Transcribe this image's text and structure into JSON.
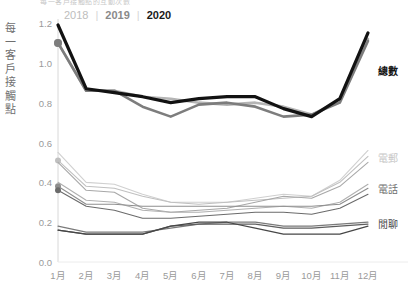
{
  "title_clipped": "每一客戶接觸點的互動次數",
  "legend": {
    "years": [
      {
        "label": "2018",
        "color": "#bdbdbd"
      },
      {
        "label": "2019",
        "color": "#8a8a8a"
      },
      {
        "label": "2020",
        "color": "#1a1a1a"
      }
    ],
    "separator": "|"
  },
  "axis": {
    "ylabel_chars": [
      "每",
      "一",
      "客",
      "戶",
      "接",
      "觸",
      "點"
    ],
    "yticks": [
      "1.2",
      "1.0",
      "0.8",
      "0.6",
      "0.4",
      "0.2",
      "0.0"
    ],
    "xticks": [
      "1月",
      "2月",
      "3月",
      "4月",
      "5月",
      "6月",
      "7月",
      "8月",
      "9月",
      "10月",
      "11月",
      "12月"
    ]
  },
  "series_labels": {
    "total": "總數",
    "email": "電郵",
    "phone": "電話",
    "chat": "閒聊"
  },
  "colors": {
    "y2018": "#c4c4c4",
    "y2019": "#8d8d8d",
    "y2020": "#141414",
    "total_2018": "#b5b5b5",
    "total_2019": "#7d7d7d",
    "total_2020": "#121212",
    "email_2018": "#d0d0d0",
    "email_2019": "#c0c0c0",
    "email_2020": "#a8a8a8",
    "phone_2018": "#b0b0b0",
    "phone_2019": "#8e8e8e",
    "phone_2020": "#6b6b6b",
    "chat_2018": "#7a7a7a",
    "chat_2019": "#5e5e5e",
    "chat_2020": "#474747",
    "axis": "#d8d8d8",
    "tick_text": "#9a9a9a"
  },
  "chart_data": {
    "type": "line",
    "title": "每一客戶接觸點的互動次數",
    "xlabel": "",
    "ylabel": "每一客戶接觸點",
    "categories": [
      "1月",
      "2月",
      "3月",
      "4月",
      "5月",
      "6月",
      "7月",
      "8月",
      "9月",
      "10月",
      "11月",
      "12月"
    ],
    "ylim": [
      0.0,
      1.2
    ],
    "yticks": [
      0.0,
      0.2,
      0.4,
      0.6,
      0.8,
      1.0,
      1.2
    ],
    "grid": false,
    "legend_position": "top-left (years), right (metrics)",
    "groups": [
      {
        "name": "總數",
        "label_y": 0.965,
        "series": [
          {
            "name": "2018",
            "year": 2018,
            "color": "#b5b5b5",
            "values": [
              1.1,
              0.86,
              0.86,
              0.83,
              0.82,
              0.8,
              0.79,
              0.8,
              0.78,
              0.74,
              0.81,
              1.12
            ],
            "marker_jan": true
          },
          {
            "name": "2019",
            "year": 2019,
            "color": "#7d7d7d",
            "values": [
              1.1,
              0.86,
              0.86,
              0.78,
              0.73,
              0.79,
              0.8,
              0.78,
              0.73,
              0.74,
              0.8,
              1.11
            ],
            "marker_jan": true
          },
          {
            "name": "2020",
            "year": 2020,
            "color": "#121212",
            "values": [
              1.19,
              0.87,
              0.85,
              0.83,
              0.8,
              0.82,
              0.83,
              0.83,
              0.77,
              0.73,
              0.82,
              1.15
            ],
            "marker_jan": false
          }
        ]
      },
      {
        "name": "電郵",
        "label_y": 0.525,
        "series": [
          {
            "name": "2018",
            "year": 2018,
            "color": "#d0d0d0",
            "values": [
              0.55,
              0.4,
              0.39,
              0.34,
              0.3,
              0.3,
              0.3,
              0.32,
              0.34,
              0.33,
              0.41,
              0.56
            ],
            "marker_jan": false
          },
          {
            "name": "2019",
            "year": 2019,
            "color": "#c0c0c0",
            "values": [
              0.51,
              0.38,
              0.37,
              0.33,
              0.3,
              0.29,
              0.3,
              0.31,
              0.32,
              0.33,
              0.4,
              0.53
            ],
            "marker_jan": true
          },
          {
            "name": "2020",
            "year": 2020,
            "color": "#a8a8a8",
            "values": [
              0.5,
              0.36,
              0.35,
              0.27,
              0.25,
              0.26,
              0.27,
              0.3,
              0.33,
              0.32,
              0.38,
              0.5
            ],
            "marker_jan": false
          }
        ]
      },
      {
        "name": "電話",
        "label_y": 0.37,
        "series": [
          {
            "name": "2018",
            "year": 2018,
            "color": "#b0b0b0",
            "values": [
              0.4,
              0.31,
              0.3,
              0.26,
              0.25,
              0.25,
              0.26,
              0.27,
              0.28,
              0.27,
              0.3,
              0.39
            ],
            "marker_jan": false
          },
          {
            "name": "2019",
            "year": 2019,
            "color": "#8e8e8e",
            "values": [
              0.38,
              0.29,
              0.29,
              0.28,
              0.28,
              0.28,
              0.28,
              0.28,
              0.28,
              0.28,
              0.29,
              0.37
            ],
            "marker_jan": true
          },
          {
            "name": "2020",
            "year": 2020,
            "color": "#6b6b6b",
            "values": [
              0.36,
              0.28,
              0.26,
              0.22,
              0.22,
              0.23,
              0.24,
              0.25,
              0.25,
              0.24,
              0.27,
              0.34
            ],
            "marker_jan": true
          }
        ]
      },
      {
        "name": "閒聊",
        "label_y": 0.195,
        "series": [
          {
            "name": "2018",
            "year": 2018,
            "color": "#7a7a7a",
            "values": [
              0.18,
              0.15,
              0.15,
              0.15,
              0.17,
              0.19,
              0.2,
              0.2,
              0.18,
              0.18,
              0.19,
              0.2
            ],
            "marker_jan": false
          },
          {
            "name": "2019",
            "year": 2019,
            "color": "#5e5e5e",
            "values": [
              0.16,
              0.14,
              0.14,
              0.14,
              0.18,
              0.19,
              0.19,
              0.19,
              0.17,
              0.17,
              0.18,
              0.19
            ],
            "marker_jan": false
          },
          {
            "name": "2020",
            "year": 2020,
            "color": "#474747",
            "values": [
              0.16,
              0.14,
              0.14,
              0.14,
              0.18,
              0.2,
              0.2,
              0.17,
              0.14,
              0.14,
              0.14,
              0.18
            ],
            "marker_jan": false
          }
        ]
      }
    ]
  }
}
